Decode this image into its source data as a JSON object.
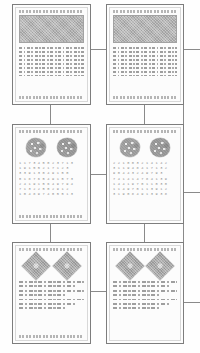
{
  "figure": {
    "layout": "2 columns x 3 rows of connected document panels",
    "panel_count": 6,
    "connector_color": "#8a8a8a",
    "panel_border_color": "#7d7d7d",
    "header_band_color": "#b4b4b4",
    "figure_fill_color": "#a6a6a6",
    "background_color": "#fefefe"
  },
  "panels": [
    {
      "id": "panel-r1c1",
      "row": 1,
      "column": 1,
      "kind": "text-document-with-header-band",
      "header_band": true,
      "text_line_count": 8,
      "caption_top": true,
      "caption_bottom": true
    },
    {
      "id": "panel-r1c2",
      "row": 1,
      "column": 2,
      "kind": "text-document-with-header-band",
      "header_band": true,
      "text_line_count": 8,
      "caption_top": true,
      "caption_bottom": true
    },
    {
      "id": "panel-r2c1",
      "row": 2,
      "column": 1,
      "kind": "blob-cluster-and-digit-grid",
      "figure_shape": "blob-cluster",
      "figure_count": 2,
      "grid_rows": 8,
      "caption_top": true,
      "caption_bottom": true
    },
    {
      "id": "panel-r2c2",
      "row": 2,
      "column": 2,
      "kind": "blob-cluster-and-digit-grid",
      "figure_shape": "blob-cluster",
      "figure_count": 2,
      "grid_rows": 8,
      "caption_top": true,
      "caption_bottom": false
    },
    {
      "id": "panel-r3c1",
      "row": 3,
      "column": 1,
      "kind": "diamond-figures-and-paragraph",
      "figure_shape": "diamond",
      "figure_count": 2,
      "text_line_count": 7,
      "caption_top": true,
      "caption_bottom": true
    },
    {
      "id": "panel-r3c2",
      "row": 3,
      "column": 2,
      "kind": "diamond-figures-and-paragraph",
      "figure_shape": "diamond",
      "figure_count": 2,
      "text_line_count": 7,
      "caption_top": true,
      "caption_bottom": false
    }
  ],
  "digit_grids": {
    "panel_r2c1": [
      "1 1 7 3 4 5 0 2 3 7 1 3",
      "1 9 1 5 5 2 1 7 1 2 3",
      "3 3 9 1 3 0 4 9 1 5 0",
      "0 1 8 7 6 5 4 9 1 5 7 3",
      "2 4 1 9 1 5 6 4 9 7 9 4",
      "7 1 3 2 2 5 0 2 9 1 2",
      "1 0 4 8 9 7 4 0 5 5 1 3"
    ],
    "panel_r2c2": [
      "2 2 1 0 0 3 2 1 4 1 4 2",
      "3 1 1 9 4 8 4 1 7 1 3 2",
      "9 0 4 4 3 2 4 9 7 9 3",
      "7 4 1 4 1 4 7 8 4 1 3 9",
      "1 4 4 1 9 7 0 1 1 0 3 0",
      "1 1 4 9 7 0 1 1 3 9 1 2",
      "3 1 9 0 8 4 9 1 3 9 3 8"
    ]
  },
  "connectors": [
    {
      "id": "conn-row1-horizontal",
      "from": "panel-r1c1",
      "to": "panel-r1c2",
      "orientation": "horizontal"
    },
    {
      "id": "conn-row2-horizontal",
      "from": "panel-r2c1",
      "to": "panel-r2c2",
      "orientation": "horizontal"
    },
    {
      "id": "conn-row3-horizontal",
      "from": "panel-r3c1",
      "to": "panel-r3c2",
      "orientation": "horizontal"
    },
    {
      "id": "conn-col1-row1-row2",
      "from": "panel-r1c1",
      "to": "panel-r2c1",
      "orientation": "vertical"
    },
    {
      "id": "conn-col2-row1-row2",
      "from": "panel-r1c2",
      "to": "panel-r2c2",
      "orientation": "vertical"
    },
    {
      "id": "conn-col1-row2-row3",
      "from": "panel-r2c1",
      "to": "panel-r3c1",
      "orientation": "vertical"
    },
    {
      "id": "conn-col2-row2-row3",
      "from": "panel-r2c2",
      "to": "panel-r3c2",
      "orientation": "vertical"
    },
    {
      "id": "conn-row1-right-stub",
      "from": "panel-r1c2",
      "to": "offscreen-right",
      "orientation": "horizontal"
    },
    {
      "id": "conn-row2-right-stub",
      "from": "panel-r2c2",
      "to": "offscreen-right",
      "orientation": "horizontal"
    },
    {
      "id": "conn-row3-right-stub",
      "from": "panel-r3c2",
      "to": "offscreen-right",
      "orientation": "horizontal"
    }
  ]
}
